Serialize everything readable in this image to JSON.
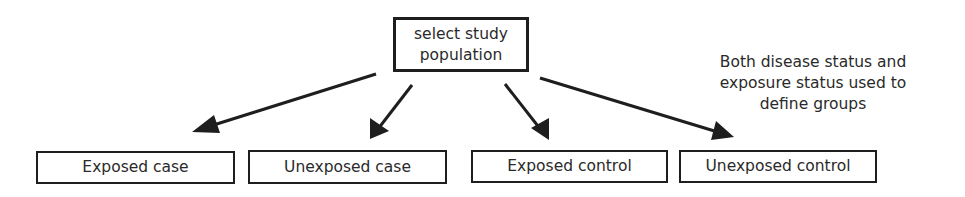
{
  "diagram": {
    "root": {
      "label_line1": "select study",
      "label_line2": "population"
    },
    "groups": [
      {
        "label": "Exposed case"
      },
      {
        "label": "Unexposed case"
      },
      {
        "label": "Exposed control"
      },
      {
        "label": "Unexposed control"
      }
    ],
    "note": {
      "line1": "Both disease status and",
      "line2": "exposure status used to",
      "line3": "define groups"
    },
    "colors": {
      "stroke": "#1e1e1e",
      "text": "#2a2a2a",
      "background": "#ffffff"
    }
  }
}
